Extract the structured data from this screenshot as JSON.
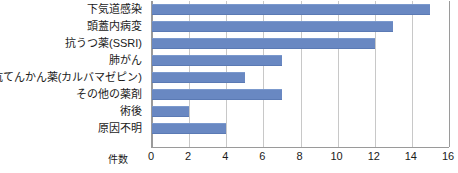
{
  "chart_data": {
    "type": "bar",
    "orientation": "horizontal",
    "title": "",
    "xlabel": "件数",
    "ylabel": "",
    "xlim": [
      0,
      16
    ],
    "xticks": [
      0,
      2,
      4,
      6,
      8,
      10,
      12,
      14,
      16
    ],
    "grid": true,
    "legend": null,
    "bar_color": "#6988c2",
    "categories": [
      "下気道感染",
      "頭蓋内病変",
      "抗うつ薬(SSRI)",
      "肺がん",
      "抗てんかん薬(カルバマゼピン)",
      "その他の薬剤",
      "術後",
      "原因不明"
    ],
    "values": [
      15,
      13,
      12,
      7,
      5,
      7,
      2,
      4
    ]
  }
}
